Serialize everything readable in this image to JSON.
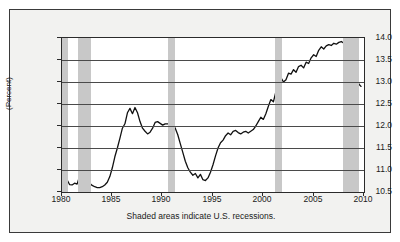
{
  "chart_data": {
    "type": "line",
    "title": "",
    "xlabel": "",
    "ylabel": "(Percent)",
    "caption": "Shaded areas indicate U.S. recessions.",
    "xlim": [
      1980,
      2010
    ],
    "ylim": [
      10.5,
      14.0
    ],
    "grid": true,
    "legend": "none",
    "xticks": [
      "1980",
      "1985",
      "1990",
      "1995",
      "2000",
      "2005",
      "2010"
    ],
    "xtick_values": [
      1980,
      1985,
      1990,
      1995,
      2000,
      2005,
      2010
    ],
    "yticks": [
      "10.5",
      "11.0",
      "11.5",
      "12.0",
      "12.5",
      "13.0",
      "13.5",
      "14.0"
    ],
    "ytick_values": [
      10.5,
      11.0,
      11.5,
      12.0,
      12.5,
      13.0,
      13.5,
      14.0
    ],
    "line_color": "#111111",
    "band_color": "#c8c8c8",
    "recession_bands": [
      {
        "start": 1980.0,
        "end": 1980.55
      },
      {
        "start": 1981.55,
        "end": 1982.9
      },
      {
        "start": 1990.55,
        "end": 1991.2
      },
      {
        "start": 2001.2,
        "end": 2001.9
      },
      {
        "start": 2007.95,
        "end": 2009.5
      }
    ],
    "x": [
      1980.0,
      1980.25,
      1980.5,
      1980.75,
      1981.0,
      1981.25,
      1981.5,
      1981.75,
      1982.0,
      1982.25,
      1982.5,
      1982.75,
      1983.0,
      1983.25,
      1983.5,
      1983.75,
      1984.0,
      1984.25,
      1984.5,
      1984.75,
      1985.0,
      1985.25,
      1985.5,
      1985.75,
      1986.0,
      1986.25,
      1986.5,
      1986.75,
      1987.0,
      1987.25,
      1987.5,
      1987.75,
      1988.0,
      1988.25,
      1988.5,
      1988.75,
      1989.0,
      1989.25,
      1989.5,
      1989.75,
      1990.0,
      1990.25,
      1990.5,
      1990.75,
      1991.0,
      1991.25,
      1991.5,
      1991.75,
      1992.0,
      1992.25,
      1992.5,
      1992.75,
      1993.0,
      1993.25,
      1993.5,
      1993.75,
      1994.0,
      1994.25,
      1994.5,
      1994.75,
      1995.0,
      1995.25,
      1995.5,
      1995.75,
      1996.0,
      1996.25,
      1996.5,
      1996.75,
      1997.0,
      1997.25,
      1997.5,
      1997.75,
      1998.0,
      1998.25,
      1998.5,
      1998.75,
      1999.0,
      1999.25,
      1999.5,
      1999.75,
      2000.0,
      2000.25,
      2000.5,
      2000.75,
      2001.0,
      2001.25,
      2001.5,
      2001.75,
      2002.0,
      2002.25,
      2002.5,
      2002.75,
      2003.0,
      2003.25,
      2003.5,
      2003.75,
      2004.0,
      2004.25,
      2004.5,
      2004.75,
      2005.0,
      2005.25,
      2005.5,
      2005.75,
      2006.0,
      2006.25,
      2006.5,
      2006.75,
      2007.0,
      2007.25,
      2007.5,
      2007.75,
      2008.0,
      2008.25,
      2008.5,
      2008.75,
      2009.0,
      2009.25,
      2009.5,
      2009.7
    ],
    "values": [
      11.2,
      11.05,
      10.78,
      10.67,
      10.66,
      10.7,
      10.68,
      10.86,
      10.72,
      10.84,
      10.8,
      10.7,
      10.65,
      10.62,
      10.6,
      10.6,
      10.62,
      10.66,
      10.72,
      10.85,
      11.05,
      11.3,
      11.5,
      11.72,
      11.95,
      12.05,
      12.3,
      12.4,
      12.28,
      12.42,
      12.3,
      12.1,
      11.95,
      11.88,
      11.82,
      11.86,
      11.95,
      12.08,
      12.1,
      12.06,
      12.02,
      12.05,
      12.05,
      12.04,
      12.02,
      11.95,
      11.8,
      11.6,
      11.4,
      11.2,
      11.05,
      10.95,
      10.88,
      10.92,
      10.82,
      10.9,
      10.78,
      10.76,
      10.82,
      10.95,
      11.12,
      11.32,
      11.5,
      11.62,
      11.68,
      11.78,
      11.84,
      11.8,
      11.88,
      11.9,
      11.85,
      11.82,
      11.86,
      11.88,
      11.84,
      11.88,
      11.92,
      12.0,
      12.1,
      12.2,
      12.15,
      12.28,
      12.45,
      12.6,
      12.55,
      12.78,
      12.85,
      13.1,
      13.0,
      13.05,
      13.2,
      13.18,
      13.28,
      13.22,
      13.35,
      13.38,
      13.32,
      13.45,
      13.42,
      13.55,
      13.62,
      13.58,
      13.72,
      13.8,
      13.75,
      13.82,
      13.85,
      13.83,
      13.88,
      13.86,
      13.9,
      13.92,
      13.88,
      13.52,
      13.6,
      13.45,
      13.3,
      13.1,
      12.95,
      12.9
    ]
  }
}
